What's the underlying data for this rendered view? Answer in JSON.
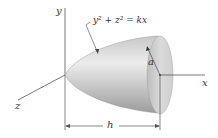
{
  "figure": {
    "type": "paraboloid-of-revolution",
    "labels": {
      "y_axis": "y",
      "x_axis": "x",
      "z_axis": "z",
      "equation": "y² + z² = kx",
      "radius": "a",
      "length": "h"
    },
    "colors": {
      "surface_light": "#e6e6e6",
      "surface_dark": "#9a9a9a",
      "base_face": "#d4d4d4",
      "axis_line": "#555555",
      "text": "#333333"
    }
  }
}
